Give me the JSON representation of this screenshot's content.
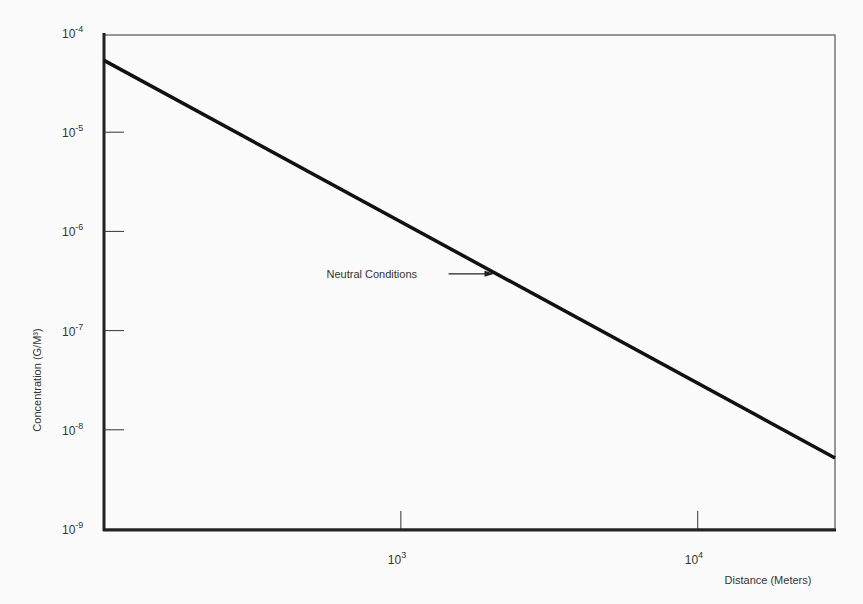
{
  "chart_data": {
    "type": "line",
    "title": "",
    "xlabel": "Distance (Meters)",
    "ylabel": "Concentration (G/M³)",
    "xscale": "log",
    "yscale": "log",
    "xlim": [
      100,
      29000
    ],
    "ylim": [
      1e-09,
      0.0001
    ],
    "grid": false,
    "x_ticks": [
      {
        "value": 1000,
        "base": "10",
        "exp": "3"
      },
      {
        "value": 10000,
        "base": "10",
        "exp": "4"
      }
    ],
    "y_ticks": [
      {
        "value": 0.0001,
        "base": "10",
        "exp": "-4"
      },
      {
        "value": 1e-05,
        "base": "10",
        "exp": "-5"
      },
      {
        "value": 1e-06,
        "base": "10",
        "exp": "-6"
      },
      {
        "value": 1e-07,
        "base": "10",
        "exp": "-7"
      },
      {
        "value": 1e-08,
        "base": "10",
        "exp": "-8"
      },
      {
        "value": 1e-09,
        "base": "10",
        "exp": "-9"
      }
    ],
    "series": [
      {
        "name": "Neutral Conditions",
        "x": [
          100,
          29000
        ],
        "y": [
          5.3e-05,
          5.2e-09
        ]
      }
    ],
    "annotations": [
      {
        "text": "Neutral Conditions",
        "points_to_x": 2100
      }
    ]
  }
}
